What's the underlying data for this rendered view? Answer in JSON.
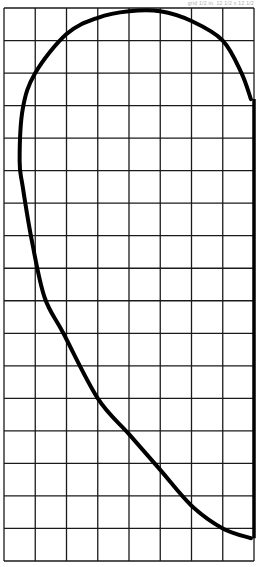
{
  "caption": "grid 1/2 in. 12 1/2 x 12 1/2",
  "pattern": {
    "name": "curved-template-pattern",
    "grid": {
      "columns": 8,
      "rows": 17
    },
    "colors": {
      "grid": "#1a1a1a",
      "curve": "#000000",
      "background": "#ffffff"
    },
    "curve_points_grid_units": [
      [
        7.9,
        16.3
      ],
      [
        7.0,
        16.0
      ],
      [
        6.0,
        15.3
      ],
      [
        5.0,
        14.2
      ],
      [
        4.0,
        13.1
      ],
      [
        3.0,
        12.0
      ],
      [
        1.9,
        10.0
      ],
      [
        1.3,
        8.9
      ],
      [
        0.9,
        7.2
      ],
      [
        0.6,
        5.5
      ],
      [
        0.5,
        4.7
      ],
      [
        0.6,
        3.1
      ],
      [
        1.0,
        2.0
      ],
      [
        2.0,
        0.8
      ],
      [
        3.0,
        0.3
      ],
      [
        4.0,
        0.1
      ],
      [
        5.0,
        0.1
      ],
      [
        6.0,
        0.4
      ],
      [
        7.0,
        1.0
      ],
      [
        7.6,
        2.0
      ],
      [
        7.9,
        2.8
      ]
    ]
  }
}
